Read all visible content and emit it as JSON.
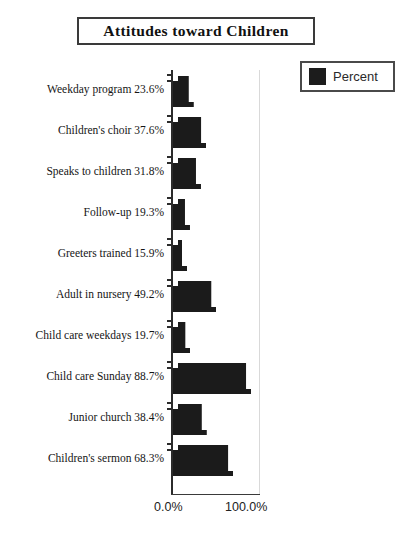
{
  "chart_data": {
    "type": "bar",
    "orientation": "horizontal",
    "title": "Attitudes toward Children",
    "xlabel": "",
    "ylabel": "",
    "xlim": [
      0,
      100
    ],
    "grid": false,
    "legend": {
      "position": "top-right",
      "entries": [
        {
          "name": "Percent",
          "color": "#1c1c1c"
        }
      ]
    },
    "axis_tick_labels": {
      "x": [
        "0.0%",
        "100.0%"
      ]
    },
    "bar_color": "#1b1b1b",
    "categories": [
      "Weekday program",
      "Children's choir",
      "Speaks to children",
      "Follow-up",
      "Greeters trained",
      "Adult in nursery",
      "Child care weekdays",
      "Child care Sunday",
      "Junior church",
      "Children's sermon"
    ],
    "values": [
      23.6,
      37.6,
      31.8,
      19.3,
      15.9,
      49.2,
      19.7,
      88.7,
      38.4,
      68.3
    ],
    "row_labels": [
      "Weekday program 23.6%",
      "Children's choir 37.6%",
      "Speaks to children 31.8%",
      "Follow-up 19.3%",
      "Greeters trained 15.9%",
      "Adult in nursery 49.2%",
      "Child care weekdays 19.7%",
      "Child care Sunday 88.7%",
      "Junior church 38.4%",
      "Children's sermon 68.3%"
    ]
  }
}
